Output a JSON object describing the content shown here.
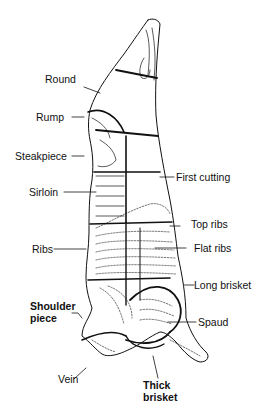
{
  "header": {
    "partial_text": ""
  },
  "diagram": {
    "stroke_color": "#111111",
    "background": "#ffffff",
    "labels_left": [
      {
        "id": "round",
        "text": "Round"
      },
      {
        "id": "rump",
        "text": "Rump"
      },
      {
        "id": "steakpiece",
        "text": "Steakpiece"
      },
      {
        "id": "sirloin",
        "text": "Sirloin"
      },
      {
        "id": "ribs",
        "text": "Ribs"
      },
      {
        "id": "shoulder",
        "text": "Shoulder"
      },
      {
        "id": "piece",
        "text": "piece"
      },
      {
        "id": "vein",
        "text": "Vein"
      }
    ],
    "labels_right": [
      {
        "id": "first_cutting",
        "text": "First cutting"
      },
      {
        "id": "top_ribs",
        "text": "Top ribs"
      },
      {
        "id": "flat_ribs",
        "text": "Flat ribs"
      },
      {
        "id": "long_brisket",
        "text": "Long brisket"
      },
      {
        "id": "spaud",
        "text": "Spaud"
      },
      {
        "id": "thick",
        "text": "Thick"
      },
      {
        "id": "brisket",
        "text": "brisket"
      }
    ]
  }
}
